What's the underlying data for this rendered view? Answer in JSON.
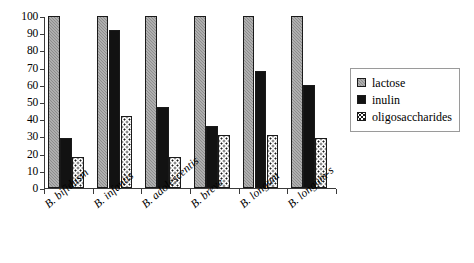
{
  "chart_data": {
    "type": "bar",
    "title": "",
    "subtitle": "",
    "xlabel": "",
    "ylabel": "",
    "ylim": [
      0,
      100
    ],
    "yticks": [
      0,
      10,
      20,
      30,
      40,
      50,
      60,
      70,
      80,
      90,
      100
    ],
    "grid": false,
    "legend_position": "right",
    "categories": [
      "B. bifidusm",
      "B. infantis",
      "B. adolescentis",
      "B. breve",
      "B. longum",
      "B. longum-s"
    ],
    "series": [
      {
        "name": "lactose",
        "color": "#8d8d8d",
        "pattern": "checker",
        "values": [
          100,
          100,
          100,
          100,
          100,
          100
        ]
      },
      {
        "name": "inulin",
        "color": "#121212",
        "pattern": "solid",
        "values": [
          29,
          92,
          47,
          36,
          68,
          60
        ]
      },
      {
        "name": "oligosaccharides",
        "color": "#ffffff",
        "pattern": "dots",
        "values": [
          18,
          42,
          18,
          31,
          31,
          29
        ]
      }
    ]
  },
  "legend": {
    "items": [
      {
        "label": "lactose"
      },
      {
        "label": "inulin"
      },
      {
        "label": "oligosaccharides"
      }
    ]
  }
}
